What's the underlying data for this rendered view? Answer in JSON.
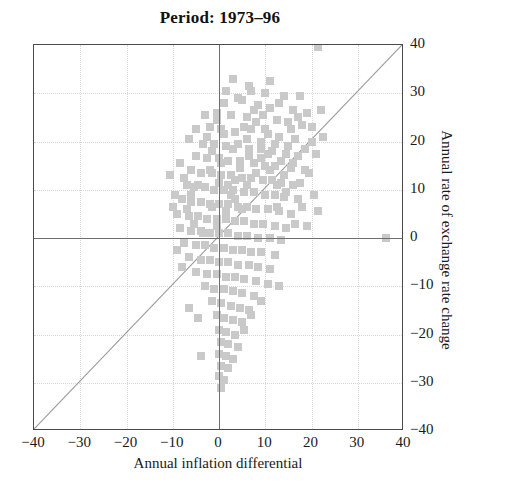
{
  "chart_data": {
    "type": "scatter",
    "title": "Period: 1973–96",
    "xlabel": "Annual inflation differential",
    "ylabel": "Annual rate of exchange rate change",
    "xlim": [
      -40,
      40
    ],
    "ylim": [
      -40,
      40
    ],
    "xticks": [
      -40,
      -30,
      -20,
      -10,
      0,
      10,
      20,
      30,
      40
    ],
    "yticks": [
      -40,
      -30,
      -20,
      -10,
      0,
      10,
      20,
      30,
      40
    ],
    "xticklabels": [
      "−40",
      "−30",
      "−20",
      "−10",
      "0",
      "10",
      "20",
      "30",
      "40"
    ],
    "yticklabels": [
      "−40",
      "−30",
      "−20",
      "−10",
      "0",
      "10",
      "20",
      "30",
      "40"
    ],
    "grid": true,
    "legend": null,
    "yaxis_position": "right",
    "marker": "square",
    "marker_color": "#c9c9c9",
    "marker_size_px": 8,
    "reference_line": {
      "name": "45-degree-line",
      "type": "identity",
      "from": [
        -40,
        -40
      ],
      "to": [
        40,
        40
      ],
      "color": "#9b9b9b"
    },
    "points": [
      [
        21.5,
        39.5
      ],
      [
        3.0,
        33.0
      ],
      [
        6.5,
        31.5
      ],
      [
        1.5,
        30.5
      ],
      [
        10.0,
        30.0
      ],
      [
        14.0,
        29.5
      ],
      [
        17.5,
        29.5
      ],
      [
        1.0,
        28.0
      ],
      [
        5.0,
        28.5
      ],
      [
        8.5,
        27.5
      ],
      [
        11.0,
        27.0
      ],
      [
        16.0,
        26.5
      ],
      [
        19.0,
        26.0
      ],
      [
        -0.5,
        26.0
      ],
      [
        2.5,
        25.5
      ],
      [
        6.0,
        25.0
      ],
      [
        9.5,
        25.5
      ],
      [
        12.5,
        24.5
      ],
      [
        15.0,
        24.0
      ],
      [
        18.0,
        23.5
      ],
      [
        -2.0,
        23.0
      ],
      [
        0.5,
        22.5
      ],
      [
        3.5,
        22.0
      ],
      [
        7.0,
        22.5
      ],
      [
        10.5,
        21.5
      ],
      [
        13.0,
        21.0
      ],
      [
        16.5,
        20.5
      ],
      [
        20.0,
        20.0
      ],
      [
        -3.5,
        19.5
      ],
      [
        -1.0,
        19.5
      ],
      [
        1.5,
        19.0
      ],
      [
        4.0,
        19.5
      ],
      [
        6.5,
        18.5
      ],
      [
        9.0,
        18.5
      ],
      [
        11.5,
        18.0
      ],
      [
        14.5,
        17.5
      ],
      [
        17.0,
        17.0
      ],
      [
        -5.0,
        17.0
      ],
      [
        -2.5,
        16.5
      ],
      [
        0.0,
        16.5
      ],
      [
        2.0,
        16.0
      ],
      [
        4.5,
        16.0
      ],
      [
        7.5,
        15.5
      ],
      [
        10.0,
        15.0
      ],
      [
        12.0,
        15.0
      ],
      [
        15.5,
        14.5
      ],
      [
        18.5,
        14.0
      ],
      [
        -6.0,
        14.0
      ],
      [
        -4.0,
        13.5
      ],
      [
        -1.5,
        13.5
      ],
      [
        0.5,
        13.0
      ],
      [
        2.5,
        13.0
      ],
      [
        5.0,
        12.5
      ],
      [
        7.0,
        12.5
      ],
      [
        9.5,
        12.0
      ],
      [
        11.5,
        12.0
      ],
      [
        13.5,
        11.5
      ],
      [
        16.0,
        11.0
      ],
      [
        -7.0,
        11.0
      ],
      [
        -5.5,
        10.5
      ],
      [
        -3.0,
        10.5
      ],
      [
        -1.0,
        10.0
      ],
      [
        1.0,
        10.0
      ],
      [
        3.0,
        10.0
      ],
      [
        5.5,
        9.5
      ],
      [
        7.5,
        9.5
      ],
      [
        10.0,
        9.0
      ],
      [
        12.0,
        9.0
      ],
      [
        14.0,
        8.5
      ],
      [
        17.0,
        8.0
      ],
      [
        -8.0,
        8.0
      ],
      [
        -6.0,
        7.5
      ],
      [
        -4.0,
        7.5
      ],
      [
        -2.0,
        7.0
      ],
      [
        0.0,
        7.0
      ],
      [
        2.0,
        7.0
      ],
      [
        4.0,
        6.5
      ],
      [
        6.0,
        6.5
      ],
      [
        8.0,
        6.0
      ],
      [
        10.5,
        6.0
      ],
      [
        13.0,
        5.5
      ],
      [
        15.5,
        5.0
      ],
      [
        -9.0,
        5.0
      ],
      [
        -6.5,
        4.5
      ],
      [
        -4.5,
        4.5
      ],
      [
        -2.5,
        4.0
      ],
      [
        -0.5,
        4.0
      ],
      [
        1.5,
        4.0
      ],
      [
        3.5,
        3.5
      ],
      [
        5.5,
        3.5
      ],
      [
        7.5,
        3.0
      ],
      [
        9.5,
        3.0
      ],
      [
        12.0,
        2.5
      ],
      [
        14.5,
        2.0
      ],
      [
        -8.5,
        2.0
      ],
      [
        -6.0,
        1.5
      ],
      [
        -4.0,
        1.5
      ],
      [
        -2.0,
        1.0
      ],
      [
        0.0,
        1.0
      ],
      [
        2.0,
        1.0
      ],
      [
        4.0,
        0.5
      ],
      [
        6.0,
        0.5
      ],
      [
        8.5,
        0.0
      ],
      [
        11.0,
        0.0
      ],
      [
        13.5,
        -0.5
      ],
      [
        36.0,
        0.0
      ],
      [
        -7.5,
        -1.0
      ],
      [
        -5.0,
        -1.5
      ],
      [
        -3.0,
        -1.5
      ],
      [
        -1.0,
        -2.0
      ],
      [
        1.0,
        -2.0
      ],
      [
        3.0,
        -2.5
      ],
      [
        5.0,
        -2.5
      ],
      [
        7.0,
        -3.0
      ],
      [
        9.0,
        -3.0
      ],
      [
        12.0,
        -3.5
      ],
      [
        -6.5,
        -4.0
      ],
      [
        -4.0,
        -4.5
      ],
      [
        -2.0,
        -4.5
      ],
      [
        0.0,
        -5.0
      ],
      [
        2.0,
        -5.0
      ],
      [
        4.0,
        -5.5
      ],
      [
        6.5,
        -5.5
      ],
      [
        8.5,
        -6.0
      ],
      [
        11.0,
        -6.5
      ],
      [
        -8.0,
        -6.0
      ],
      [
        -5.0,
        -7.0
      ],
      [
        -2.5,
        -7.5
      ],
      [
        -0.5,
        -7.5
      ],
      [
        1.5,
        -8.0
      ],
      [
        3.5,
        -8.0
      ],
      [
        5.5,
        -8.5
      ],
      [
        8.0,
        -9.0
      ],
      [
        10.5,
        -9.5
      ],
      [
        -3.0,
        -10.0
      ],
      [
        -1.0,
        -10.5
      ],
      [
        1.0,
        -10.5
      ],
      [
        3.0,
        -11.0
      ],
      [
        5.0,
        -11.5
      ],
      [
        7.5,
        -12.0
      ],
      [
        13.0,
        -10.0
      ],
      [
        -1.5,
        -13.0
      ],
      [
        0.5,
        -13.5
      ],
      [
        2.5,
        -14.0
      ],
      [
        4.5,
        -14.5
      ],
      [
        6.5,
        -15.0
      ],
      [
        9.0,
        -13.0
      ],
      [
        -0.5,
        -16.0
      ],
      [
        1.0,
        -16.5
      ],
      [
        3.0,
        -17.0
      ],
      [
        5.0,
        -17.5
      ],
      [
        7.0,
        -16.0
      ],
      [
        -6.5,
        -14.5
      ],
      [
        -4.5,
        -16.5
      ],
      [
        0.0,
        -19.0
      ],
      [
        1.5,
        -19.5
      ],
      [
        3.5,
        -20.0
      ],
      [
        5.5,
        -19.0
      ],
      [
        0.5,
        -21.5
      ],
      [
        2.0,
        -22.0
      ],
      [
        4.0,
        -22.5
      ],
      [
        -4.0,
        -24.5
      ],
      [
        0.0,
        -24.0
      ],
      [
        1.5,
        -24.5
      ],
      [
        3.0,
        -25.0
      ],
      [
        0.5,
        -26.5
      ],
      [
        2.0,
        -27.0
      ],
      [
        0.0,
        -28.5
      ],
      [
        1.0,
        -29.5
      ],
      [
        0.5,
        -31.0
      ],
      [
        -9.5,
        9.0
      ],
      [
        -10.0,
        6.5
      ],
      [
        -9.0,
        -2.5
      ],
      [
        -10.5,
        13.0
      ],
      [
        19.5,
        13.5
      ],
      [
        21.0,
        17.5
      ],
      [
        22.5,
        21.0
      ],
      [
        13.0,
        28.0
      ],
      [
        7.0,
        30.5
      ],
      [
        4.0,
        29.0
      ],
      [
        15.0,
        19.0
      ],
      [
        20.5,
        9.0
      ],
      [
        18.0,
        6.5
      ],
      [
        16.5,
        3.0
      ],
      [
        14.0,
        13.0
      ],
      [
        17.5,
        11.5
      ],
      [
        12.5,
        6.5
      ],
      [
        -7.5,
        12.5
      ],
      [
        -8.5,
        15.5
      ],
      [
        -6.5,
        20.5
      ],
      [
        -5.0,
        22.5
      ],
      [
        -3.0,
        25.5
      ],
      [
        11.0,
        32.5
      ],
      [
        8.0,
        24.0
      ],
      [
        6.0,
        20.5
      ],
      [
        9.0,
        16.5
      ],
      [
        11.0,
        14.0
      ],
      [
        5.0,
        6.0
      ],
      [
        3.5,
        8.0
      ],
      [
        2.0,
        11.0
      ],
      [
        0.5,
        15.5
      ],
      [
        -1.5,
        18.0
      ],
      [
        -2.5,
        21.0
      ],
      [
        19.0,
        2.5
      ],
      [
        21.5,
        5.5
      ],
      [
        12.0,
        19.5
      ],
      [
        10.0,
        22.5
      ],
      [
        7.5,
        26.5
      ],
      [
        5.5,
        23.0
      ],
      [
        3.0,
        18.5
      ],
      [
        1.0,
        21.5
      ],
      [
        -0.5,
        24.5
      ],
      [
        15.5,
        22.5
      ],
      [
        17.0,
        25.0
      ],
      [
        13.5,
        16.0
      ],
      [
        9.0,
        20.0
      ],
      [
        6.5,
        17.0
      ],
      [
        4.5,
        14.5
      ],
      [
        2.5,
        9.0
      ],
      [
        0.0,
        11.5
      ],
      [
        -2.0,
        14.0
      ],
      [
        -4.5,
        11.0
      ],
      [
        -6.0,
        9.0
      ],
      [
        -7.0,
        6.0
      ],
      [
        -5.5,
        3.0
      ],
      [
        -3.5,
        1.0
      ],
      [
        -1.5,
        6.5
      ],
      [
        -0.5,
        2.5
      ],
      [
        1.5,
        5.5
      ],
      [
        3.5,
        12.0
      ],
      [
        6.0,
        11.0
      ],
      [
        8.0,
        13.5
      ],
      [
        10.5,
        17.5
      ],
      [
        12.5,
        11.0
      ],
      [
        14.5,
        9.5
      ],
      [
        16.0,
        15.5
      ],
      [
        18.5,
        18.5
      ],
      [
        20.0,
        23.0
      ],
      [
        22.0,
        26.5
      ]
    ]
  }
}
